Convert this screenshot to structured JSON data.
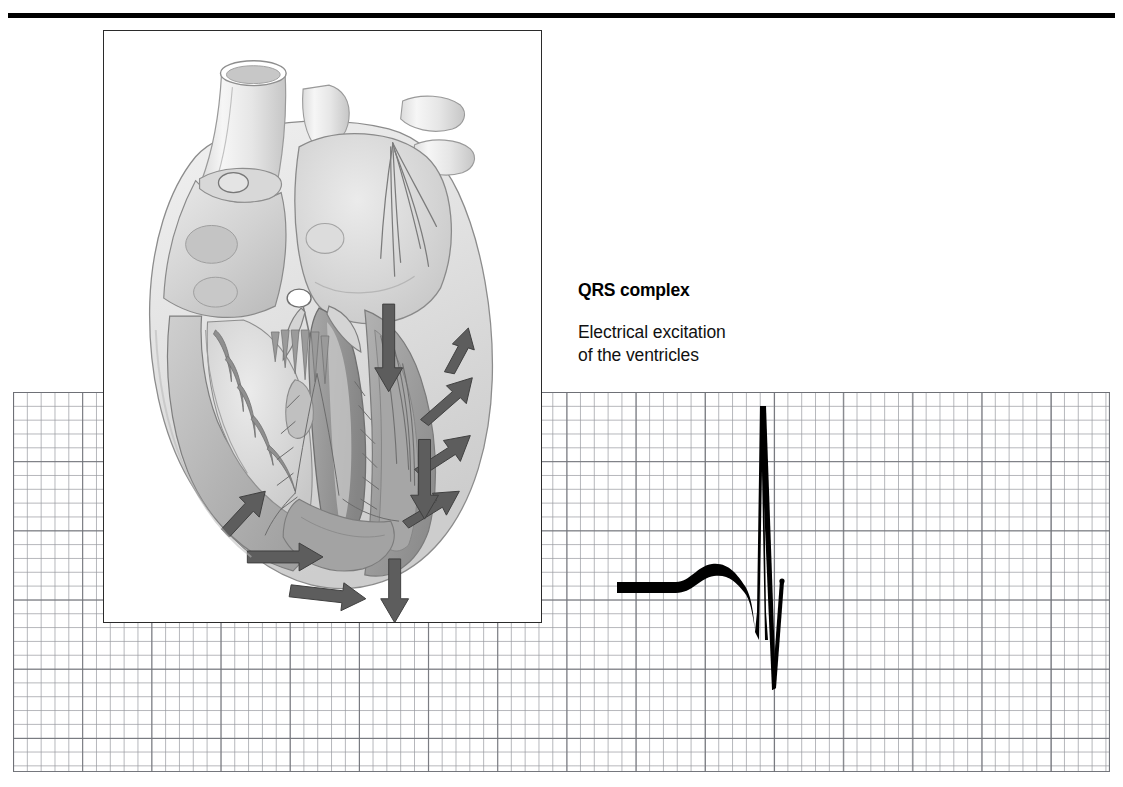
{
  "figure": {
    "kind": "medical-illustration",
    "top_rule_color": "#000000",
    "background_color": "#ffffff"
  },
  "caption": {
    "title": "QRS complex",
    "line1": "Electrical excitation",
    "line2": "of the ventricles"
  },
  "illustration": {
    "name": "heart-cross-section",
    "description": "Cross-section of the heart showing electrical excitation spreading through the ventricles",
    "border_color": "#2b2b2b",
    "tones": {
      "lightest": "#f2f2f2",
      "light": "#e2e2e2",
      "mid": "#c9c9c9",
      "mid_dark": "#b0b0b0",
      "dark": "#9a9a9a",
      "outline": "#6e6e6e",
      "arrow": "#5a5a5a"
    },
    "structures": [
      "aorta",
      "superior vena cava",
      "pulmonary artery",
      "pulmonary veins",
      "right atrium",
      "left atrium",
      "right ventricle",
      "left ventricle",
      "interventricular septum",
      "papillary muscles",
      "chordae tendineae",
      "atrioventricular node",
      "bundle of His",
      "Purkinje fibers"
    ],
    "arrows": {
      "count": 9,
      "meaning": "direction of excitation spread through ventricular myocardium",
      "directions": [
        "up-right",
        "right",
        "down-right",
        "down",
        "down",
        "down",
        "left",
        "left",
        "up-left"
      ]
    }
  },
  "ecg": {
    "grid": {
      "cell_px": 13.84,
      "heavy_every": 5,
      "fine_line_color": "#96989e",
      "heavy_line_color": "#6e7076",
      "left": 13,
      "top": 392,
      "width": 1097,
      "height": 380
    },
    "trace": {
      "color": "#000000",
      "highlighted_segment": "QRS complex",
      "baseline_y": 588,
      "waves": [
        {
          "name": "baseline",
          "from_x": 617,
          "to_x": 677,
          "y": 588,
          "thickness": 11
        },
        {
          "name": "P-wave",
          "peak_x": 712,
          "peak_y": 568,
          "onset_x": 677,
          "offset_x": 748
        },
        {
          "name": "Q",
          "x": 755,
          "y": 632
        },
        {
          "name": "R",
          "x": 761,
          "y": 406
        },
        {
          "name": "S",
          "x": 774,
          "y": 688
        },
        {
          "name": "T-upstroke",
          "x": 783,
          "y": 580
        }
      ]
    }
  }
}
